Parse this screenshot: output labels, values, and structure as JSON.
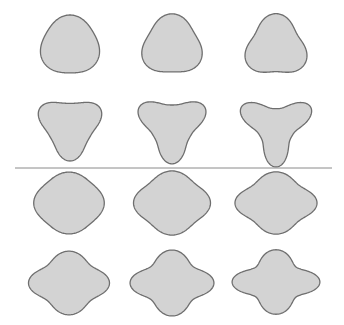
{
  "figure": {
    "background": "#ffffff",
    "fill_color": "#d3d3d3",
    "stroke_color": "#6e6e6e",
    "divider": {
      "x1": 15,
      "x2": 332,
      "y": 168,
      "color": "#8a8a8a"
    },
    "groups": [
      {
        "name": "three-lobed-shapes",
        "symmetry": 3,
        "shapes": [
          {
            "cx": 70,
            "cy": 46,
            "r": 29,
            "amp": 0.07,
            "amp2": 0.0,
            "sx": 1.0,
            "sy": 1.0,
            "rot": -90
          },
          {
            "cx": 172,
            "cy": 46,
            "r": 29,
            "amp": 0.11,
            "amp2": 0.0,
            "sx": 1.0,
            "sy": 1.0,
            "rot": -90
          },
          {
            "cx": 276,
            "cy": 47,
            "r": 29,
            "amp": 0.15,
            "amp2": 0.0,
            "sx": 1.0,
            "sy": 1.0,
            "rot": -90
          },
          {
            "cx": 70,
            "cy": 126,
            "r": 28,
            "amp": 0.22,
            "amp2": 0.03,
            "sx": 1.0,
            "sy": 1.0,
            "rot": 90
          },
          {
            "cx": 172,
            "cy": 126,
            "r": 28,
            "amp": 0.3,
            "amp2": 0.05,
            "sx": 1.0,
            "sy": 1.0,
            "rot": 90
          },
          {
            "cx": 276,
            "cy": 127,
            "r": 27,
            "amp": 0.4,
            "amp2": 0.08,
            "sx": 1.0,
            "sy": 1.0,
            "rot": 90
          }
        ]
      },
      {
        "name": "four-lobed-shapes",
        "symmetry": 4,
        "shapes": [
          {
            "cx": 69,
            "cy": 203,
            "r": 32,
            "amp": 0.05,
            "amp2": 0.0,
            "sx": 1.05,
            "sy": 0.92,
            "rot": 0
          },
          {
            "cx": 172,
            "cy": 203,
            "r": 33,
            "amp": 0.08,
            "amp2": 0.0,
            "sx": 1.08,
            "sy": 0.9,
            "rot": 0
          },
          {
            "cx": 276,
            "cy": 203,
            "r": 33,
            "amp": 0.11,
            "amp2": 0.0,
            "sx": 1.12,
            "sy": 0.85,
            "rot": 0
          },
          {
            "cx": 69,
            "cy": 283,
            "r": 32,
            "amp": 0.13,
            "amp2": 0.0,
            "sx": 1.12,
            "sy": 0.88,
            "rot": 0
          },
          {
            "cx": 172,
            "cy": 283,
            "r": 32,
            "amp": 0.17,
            "amp2": 0.0,
            "sx": 1.12,
            "sy": 0.88,
            "rot": 0
          },
          {
            "cx": 276,
            "cy": 282,
            "r": 31,
            "amp": 0.21,
            "amp2": 0.0,
            "sx": 1.17,
            "sy": 0.86,
            "rot": 0
          }
        ]
      }
    ]
  }
}
